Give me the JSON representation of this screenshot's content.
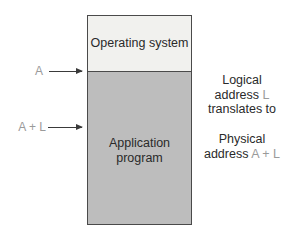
{
  "diagram": {
    "type": "memory-layout",
    "regions": [
      {
        "id": "os",
        "label": "Operating system",
        "fill": "#f1f1ee"
      },
      {
        "id": "app",
        "label_line1": "Application",
        "label_line2": "program",
        "fill": "#bdbdbd"
      }
    ],
    "markers": [
      {
        "label": "A",
        "points_to": "start of application program"
      },
      {
        "label": "A + L",
        "points_to": "address within application program"
      }
    ],
    "annotation": {
      "line1": "Logical",
      "line2_prefix": "address ",
      "line2_var": "L",
      "line3": "translates to",
      "line4": "Physical",
      "line5_prefix": "address ",
      "line5_var": "A + L"
    },
    "colors": {
      "border": "#4a4a4a",
      "variable_text": "#9a9a9a",
      "text": "#2a2a2a"
    }
  }
}
